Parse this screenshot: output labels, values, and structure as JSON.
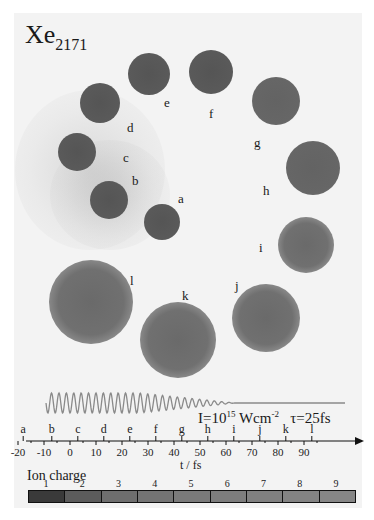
{
  "figure": {
    "title_main": "Xe",
    "title_sub": "2171",
    "clusters": [
      {
        "label": "a",
        "cx": 162,
        "cy": 222,
        "r": 18,
        "state": "dense",
        "label_x": 178,
        "label_y": 192
      },
      {
        "label": "b",
        "cx": 109,
        "cy": 200,
        "r": 19,
        "state": "dense",
        "label_x": 132,
        "label_y": 174
      },
      {
        "label": "c",
        "cx": 77,
        "cy": 152,
        "r": 19,
        "state": "dense",
        "label_x": 123,
        "label_y": 151
      },
      {
        "label": "d",
        "cx": 100,
        "cy": 103,
        "r": 20,
        "state": "dense",
        "label_x": 127,
        "label_y": 121
      },
      {
        "label": "e",
        "cx": 149,
        "cy": 74,
        "r": 21,
        "state": "dense",
        "label_x": 164,
        "label_y": 96
      },
      {
        "label": "f",
        "cx": 211,
        "cy": 72,
        "r": 22,
        "state": "dense",
        "label_x": 209,
        "label_y": 107
      },
      {
        "label": "g",
        "cx": 276,
        "cy": 101,
        "r": 24,
        "state": "mid",
        "label_x": 254,
        "label_y": 136
      },
      {
        "label": "h",
        "cx": 313,
        "cy": 168,
        "r": 27,
        "state": "mid",
        "label_x": 263,
        "label_y": 184
      },
      {
        "label": "i",
        "cx": 306,
        "cy": 245,
        "r": 28,
        "state": "exp",
        "label_x": 259,
        "label_y": 241
      },
      {
        "label": "j",
        "cx": 266,
        "cy": 318,
        "r": 34,
        "state": "exp",
        "label_x": 235,
        "label_y": 279
      },
      {
        "label": "k",
        "cx": 178,
        "cy": 340,
        "r": 38,
        "state": "exp",
        "label_x": 182,
        "label_y": 289
      },
      {
        "label": "l",
        "cx": 91,
        "cy": 302,
        "r": 42,
        "state": "exp",
        "label_x": 130,
        "label_y": 274
      }
    ],
    "laser": {
      "prefix": "I=10",
      "exponent": "15",
      "unit": " Wcm",
      "unit_exp": "-2",
      "pulse": "τ=25fs",
      "color": "#8a8a8a"
    },
    "time_axis": {
      "xlabel": "t / fs",
      "ticks": [
        "-20",
        "-10",
        "0",
        "10",
        "20",
        "30",
        "40",
        "50",
        "60",
        "70",
        "80",
        "90"
      ],
      "snapshot_letters": [
        "a",
        "b",
        "c",
        "d",
        "e",
        "f",
        "g",
        "h",
        "i",
        "j",
        "k",
        "l"
      ]
    },
    "ion_charge": {
      "title": "Ion charge",
      "levels": [
        "1",
        "2",
        "3",
        "4",
        "5",
        "6",
        "7",
        "8",
        "9"
      ],
      "colors": [
        "#3a3a3a",
        "#5c5c5c",
        "#6e6e6e",
        "#747474",
        "#7a7a7a",
        "#7d7d7d",
        "#808080",
        "#838383",
        "#868686"
      ]
    }
  },
  "chart_data": {
    "type": "diagram",
    "title": "Xe2171",
    "snapshot_times_fs": {
      "a": -18,
      "b": -7,
      "c": 3,
      "d": 13,
      "e": 23,
      "f": 33,
      "g": 43,
      "h": 53,
      "i": 63,
      "j": 73,
      "k": 83,
      "l": 93
    },
    "xlabel": "t / fs",
    "xlim": [
      -20,
      95
    ],
    "colorbar": {
      "label": "Ion charge",
      "values": [
        1,
        2,
        3,
        4,
        5,
        6,
        7,
        8,
        9
      ]
    }
  }
}
